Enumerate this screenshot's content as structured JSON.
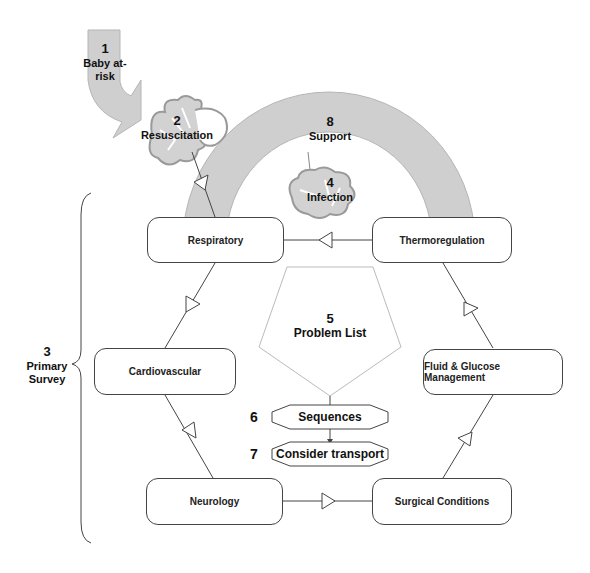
{
  "diagram": {
    "baby_at_risk": {
      "number": "1",
      "label_line1": "Baby at-",
      "label_line2": "risk"
    },
    "resuscitation": {
      "number": "2",
      "label": "Resuscitation"
    },
    "primary_survey": {
      "number": "3",
      "label_line1": "Primary",
      "label_line2": "Survey"
    },
    "infection": {
      "number": "4",
      "label": "Infection"
    },
    "problem_list": {
      "number": "5",
      "label": "Problem List"
    },
    "sequences": {
      "number": "6",
      "label": "Sequences"
    },
    "consider_transport": {
      "number": "7",
      "label": "Consider transport"
    },
    "support": {
      "number": "8",
      "label": "Support"
    },
    "nodes": {
      "respiratory": "Respiratory",
      "thermoregulation": "Thermoregulation",
      "cardiovascular": "Cardiovascular",
      "fluid_glucose": "Fluid & Glucose Management",
      "neurology": "Neurology",
      "surgical": "Surgical Conditions"
    },
    "colors": {
      "gray_fill": "#cfcfcf",
      "stroke": "#444444",
      "light_stroke": "#bbbbbb"
    }
  }
}
